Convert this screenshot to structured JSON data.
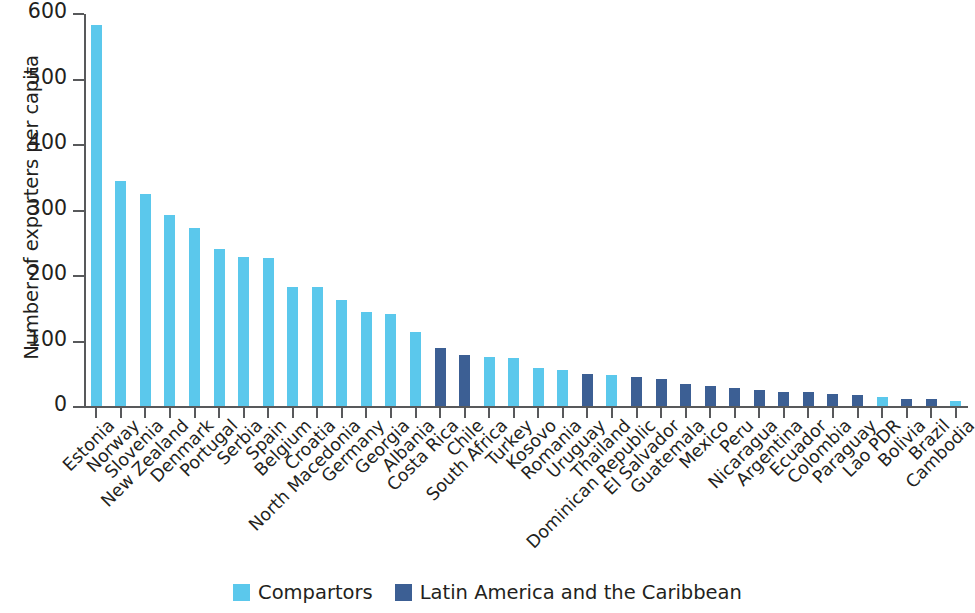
{
  "chart_data": {
    "type": "bar",
    "title": "",
    "xlabel": "",
    "ylabel": "Number of exporters per capita",
    "ylim": [
      0,
      600
    ],
    "ytick_values": [
      0,
      100,
      200,
      300,
      400,
      500,
      600
    ],
    "ytick_labels": [
      "0",
      "100",
      "200",
      "300",
      "400",
      "500",
      "600"
    ],
    "grid": false,
    "legend_position": "bottom-center",
    "legend": [
      {
        "label": "Compartors",
        "color": "#5BC8EC"
      },
      {
        "label": "Latin America and the Caribbean",
        "color": "#3C5F94"
      }
    ],
    "categories": [
      "Estonia",
      "Norway",
      "Slovenia",
      "New Zealand",
      "Denmark",
      "Portugal",
      "Serbia",
      "Spain",
      "Belgium",
      "Croatia",
      "North Macedonia",
      "Germany",
      "Georgia",
      "Albania",
      "Costa Rica",
      "Chile",
      "South Africa",
      "Turkey",
      "Kosovo",
      "Romania",
      "Uruguay",
      "Thailand",
      "Dominican Republic",
      "El Salvador",
      "Guatemala",
      "Mexico",
      "Peru",
      "Nicaragua",
      "Argentina",
      "Ecuador",
      "Colombia",
      "Paraguay",
      "Lao PDR",
      "Bolivia",
      "Brazil",
      "Cambodia"
    ],
    "values": [
      582,
      344,
      323,
      292,
      272,
      240,
      228,
      226,
      181,
      181,
      162,
      144,
      140,
      113,
      88,
      78,
      75,
      73,
      58,
      55,
      49,
      48,
      44,
      42,
      34,
      31,
      27,
      24,
      22,
      22,
      18,
      17,
      14,
      11,
      10,
      7
    ],
    "groups": [
      "Compartors",
      "Compartors",
      "Compartors",
      "Compartors",
      "Compartors",
      "Compartors",
      "Compartors",
      "Compartors",
      "Compartors",
      "Compartors",
      "Compartors",
      "Compartors",
      "Compartors",
      "Compartors",
      "Latin America and the Caribbean",
      "Latin America and the Caribbean",
      "Compartors",
      "Compartors",
      "Compartors",
      "Compartors",
      "Latin America and the Caribbean",
      "Compartors",
      "Latin America and the Caribbean",
      "Latin America and the Caribbean",
      "Latin America and the Caribbean",
      "Latin America and the Caribbean",
      "Latin America and the Caribbean",
      "Latin America and the Caribbean",
      "Latin America and the Caribbean",
      "Latin America and the Caribbean",
      "Latin America and the Caribbean",
      "Latin America and the Caribbean",
      "Compartors",
      "Latin America and the Caribbean",
      "Latin America and the Caribbean",
      "Compartors"
    ]
  }
}
